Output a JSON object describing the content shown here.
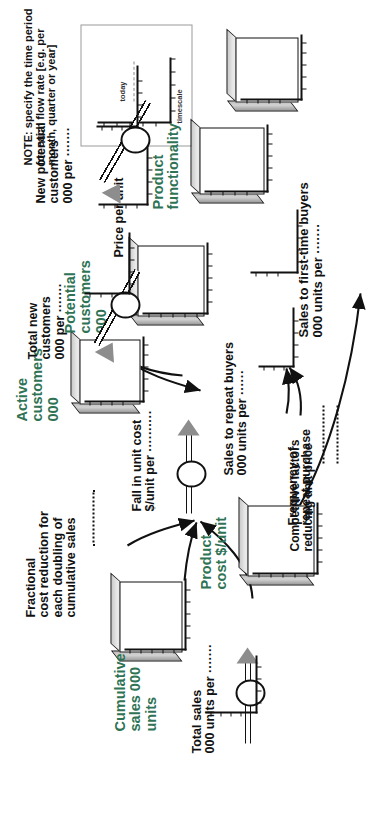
{
  "diagram": {
    "accent_green": "#2f7355",
    "ink": "#111111"
  },
  "note": {
    "text": "NOTE: specify the time period\nfor each flow rate [e.g. per\nmonth, quarter or year]",
    "chart": {
      "today_label": "today",
      "timescale_label": "timescale"
    }
  },
  "stocks": [
    {
      "id": "cumulative-sales",
      "label": "Cumulative\nsales 000 units",
      "color": "green"
    },
    {
      "id": "product-cost",
      "label": "Product\ncost $/unit",
      "color": "green"
    },
    {
      "id": "active-customers",
      "label": "Active\ncustomers\n000",
      "color": "green"
    },
    {
      "id": "potential-customers",
      "label": "Potential\ncustomers\n000",
      "color": "green"
    },
    {
      "id": "product-functionality",
      "label": "Product\nfunctionality",
      "color": "green"
    },
    {
      "id": "unlabelled-source",
      "label": "",
      "color": "green"
    }
  ],
  "flows": [
    {
      "id": "total-sales",
      "label": "Total sales\n000 units per ·······"
    },
    {
      "id": "fall-in-unit-cost",
      "label": "Fall in unit cost\n$/unit per ··········"
    },
    {
      "id": "total-new-customers",
      "label": "Total new\ncustomers\n000 per ·······"
    },
    {
      "id": "new-potential-customers",
      "label": "New potential\ncustomers\n000 per ·······"
    }
  ],
  "auxiliaries": [
    {
      "id": "sales-to-first-time-buyers",
      "label": "Sales to first-time buyers\n000 units per ·······"
    },
    {
      "id": "sales-to-repeat-buyers",
      "label": "Sales to repeat buyers\n000 units per ······"
    },
    {
      "id": "frequency-of-repeat-purchase",
      "label": "Frequency of\nrepeat purchase"
    },
    {
      "id": "fractional-cost-reduction",
      "label": "Fractional\ncost reduction for\neach doubling of\ncumulative sales"
    },
    {
      "id": "competitive-factors",
      "label": "Competitive factors\nreducing unit price"
    },
    {
      "id": "price-per-unit",
      "label": "Price per unit"
    }
  ]
}
